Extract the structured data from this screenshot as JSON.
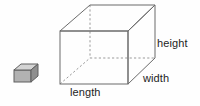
{
  "figure": {
    "background_color": "#fefefe",
    "line_color": "#6b6b6b",
    "hidden_line_color": "#9a9a9a",
    "text_color": "#1d1d1d",
    "labels": {
      "height": "height",
      "width": "width",
      "length": "length"
    },
    "large_box": {
      "name": "rectangular-prism",
      "front_face": {
        "left": 60,
        "top": 31,
        "right": 128,
        "bottom": 84
      },
      "depth_offset": {
        "dx": 27,
        "dy": -26
      },
      "visible_edges": "top-face, front-face, right-face",
      "hidden_edges": "back-left-vertical, back-bottom-horizontal, bottom-left-diagonal"
    },
    "small_cube": {
      "name": "unit-cube",
      "left": 14,
      "top": 64,
      "width": 24,
      "height": 18,
      "front_fill": "#b0b0b0",
      "top_fill": "#d2d2d2",
      "side_fill": "#8f8f8f"
    }
  }
}
